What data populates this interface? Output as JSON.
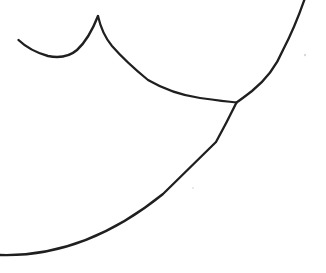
{
  "canvas": {
    "width": 326,
    "height": 273,
    "background_color": "#ffffff",
    "ink_color": "#1f1f1f"
  },
  "drawing": {
    "description": "hand-drawn black ink line-art fragment: scalloped dip curve rising to a sharp cusp at top-left, a shallow curve running right to a Y-junction where a large arc from the top edge meets a long sweeping curve descending to the bottom-left edge",
    "strokes": [
      {
        "name": "scallop-dip-curve",
        "path": "M 18.5,40 Q 30,51 48,56 Q 66,59.5 77,50 Q 89,39 98,16",
        "width": 2.4
      },
      {
        "name": "cusp-right-descending-curve",
        "path": "M 98,16 Q 102,34 112,46 Q 126,62 148,80 Q 172,94 200,98 Q 225,101.5 236.5,102.5",
        "width": 2.2
      },
      {
        "name": "upper-right-arc",
        "path": "M 305,-2 Q 295,27 283,50 Q 273,74 252,91 Q 241,99.5 236.5,102.5",
        "width": 2.3
      },
      {
        "name": "lower-sweep-curve",
        "path": "M 236.5,102.5 Q 227,122 216,142 Q 185.5,172 163,194 Q 84.5,257.5 0,255",
        "width": 2.3
      }
    ],
    "marks": [
      {
        "name": "paper-speck-1",
        "cx": 305,
        "cy": 55,
        "r": 1.2,
        "color": "#d9d9d9"
      },
      {
        "name": "paper-speck-2",
        "cx": 193,
        "cy": 188,
        "r": 1.0,
        "color": "#e2e2e2"
      }
    ]
  }
}
